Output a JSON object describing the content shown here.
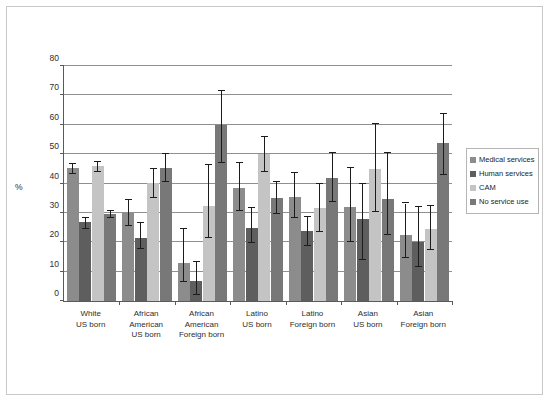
{
  "chart_data": {
    "type": "bar",
    "title": "",
    "xlabel": "",
    "ylabel": "%",
    "ylim": [
      0,
      80
    ],
    "ytick_step": 10,
    "yticks": [
      0,
      10,
      20,
      30,
      40,
      50,
      60,
      70,
      80
    ],
    "grid": true,
    "legend_position": "right",
    "error_bars": true,
    "categories": [
      "White\nUS born",
      "African American\nUS born",
      "African American\nForeign born",
      "Latino\nUS born",
      "Latino\nForeign born",
      "Asian\nUS born",
      "Asian\nForeign born"
    ],
    "category_lines": [
      [
        "White",
        "US born"
      ],
      [
        "African",
        "American",
        "US born"
      ],
      [
        "African",
        "American",
        "Foreign born"
      ],
      [
        "Latino",
        "US born"
      ],
      [
        "Latino",
        "Foreign born"
      ],
      [
        "Asian",
        "US born"
      ],
      [
        "Asian",
        "Foreign born"
      ]
    ],
    "series": [
      {
        "name": "Medical services",
        "color": "#8c8c8c",
        "values": [
          45.2,
          30.0,
          13.1,
          38.5,
          35.5,
          31.9,
          22.6
        ],
        "err_low": [
          43.4,
          25.6,
          6.6,
          30.5,
          28.2,
          20.1,
          14.6
        ],
        "err_high": [
          46.8,
          34.5,
          24.4,
          46.9,
          43.6,
          45.2,
          33.2
        ]
      },
      {
        "name": "Human services",
        "color": "#5e5e5e",
        "values": [
          26.9,
          21.4,
          6.9,
          24.9,
          23.9,
          28.0,
          20.2
        ],
        "err_low": [
          24.6,
          17.7,
          1.9,
          19.7,
          18.6,
          13.9,
          11.6
        ],
        "err_high": [
          28.4,
          26.5,
          13.2,
          31.6,
          28.5,
          40.0,
          32.1
        ]
      },
      {
        "name": "CAM",
        "color": "#c4c4c4",
        "values": [
          45.8,
          40.1,
          32.5,
          50.0,
          31.6,
          45.1,
          24.5
        ],
        "err_low": [
          44.0,
          35.2,
          21.6,
          44.0,
          23.6,
          30.2,
          17.2
        ],
        "err_high": [
          47.2,
          45.0,
          46.3,
          55.9,
          40.0,
          60.2,
          32.4
        ]
      },
      {
        "name": "No service use",
        "color": "#787878",
        "values": [
          29.5,
          45.2,
          60.0,
          35.1,
          41.8,
          34.7,
          53.7
        ],
        "err_low": [
          28.4,
          40.6,
          46.9,
          29.7,
          33.6,
          22.6,
          42.8
        ],
        "err_high": [
          30.6,
          49.9,
          71.6,
          40.6,
          50.4,
          50.3,
          63.8
        ]
      }
    ]
  },
  "legend": {
    "items": [
      {
        "label": "Medical services",
        "color": "#8c8c8c"
      },
      {
        "label": "Human services",
        "color": "#5e5e5e"
      },
      {
        "label": "CAM",
        "color": "#c4c4c4"
      },
      {
        "label": "No service use",
        "color": "#787878"
      }
    ]
  },
  "axis": {
    "y_label": "%",
    "y_ticks": [
      "0",
      "10",
      "20",
      "30",
      "40",
      "50",
      "60",
      "70",
      "80"
    ]
  }
}
